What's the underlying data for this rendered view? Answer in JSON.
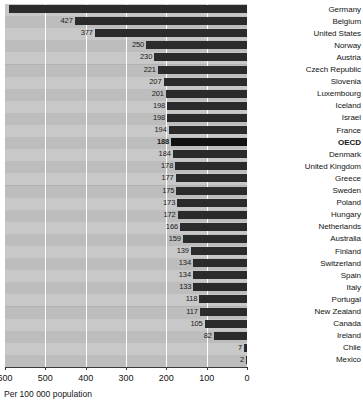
{
  "chart_data": {
    "type": "bar",
    "orientation": "horizontal",
    "title": "",
    "subtitle": "",
    "xlabel": "Per 100 000 population",
    "ylabel": "",
    "xlim": [
      600,
      0
    ],
    "x_axis_reversed": true,
    "xticks": [
      600,
      500,
      400,
      300,
      200,
      100,
      0
    ],
    "xtick_labels": [
      "600",
      "500",
      "400",
      "300",
      "200",
      "100",
      "0"
    ],
    "grid": true,
    "grid_axis": "x",
    "legend": null,
    "legend_position": "none",
    "bar_color": "#2b2b2b",
    "highlight_color": "#121212",
    "plot_background": "#b2b2b2",
    "band_color": "#c8c8c8",
    "highlight_category": "OECD",
    "categories": [
      "Germany",
      "Belgium",
      "United States",
      "Norway",
      "Austria",
      "Czech Republic",
      "Slovenia",
      "Luxembourg",
      "Iceland",
      "Israel",
      "France",
      "OECD",
      "Denmark",
      "United Kingdom",
      "Greece",
      "Sweden",
      "Poland",
      "Hungary",
      "Netherlands",
      "Australia",
      "Finland",
      "Switzerland",
      "Spain",
      "Italy",
      "Portugal",
      "New Zealand",
      "Canada",
      "Ireland",
      "Chile",
      "Mexico"
    ],
    "values": [
      590,
      427,
      377,
      250,
      230,
      221,
      207,
      201,
      198,
      198,
      194,
      188,
      184,
      178,
      177,
      175,
      173,
      172,
      166,
      159,
      139,
      134,
      134,
      133,
      118,
      117,
      105,
      82,
      7,
      2
    ],
    "data_labels": [
      "",
      "427",
      "377",
      "250",
      "230",
      "221",
      "207",
      "201",
      "198",
      "198",
      "194",
      "188",
      "184",
      "178",
      "177",
      "175",
      "173",
      "172",
      "166",
      "159",
      "139",
      "134",
      "134",
      "133",
      "118",
      "117",
      "105",
      "82",
      "7",
      "2"
    ]
  }
}
